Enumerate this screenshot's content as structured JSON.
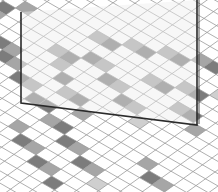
{
  "scene": {
    "description": "Perspective illustration of a diamond-tiled floor with a standing glass panel",
    "colors": {
      "background": "#ffffff",
      "grid_line": "#9a9a9a",
      "tile_dark": "#7c7c7c",
      "tile_mid": "#a6a6a6",
      "tile_light": "#cfcfcf",
      "panel_frame": "#2a2a2a",
      "panel_glass": "#eeeeee"
    },
    "panel": {
      "top_left": [
        21,
        12
      ],
      "bottom_left": [
        21,
        103
      ],
      "bottom_right": [
        197,
        125
      ],
      "top_right": [
        197,
        0
      ]
    },
    "shaded_tiles": [
      [
        2,
        9,
        "d"
      ],
      [
        3,
        9,
        "m"
      ],
      [
        3,
        10,
        "d"
      ],
      [
        4,
        10,
        "m"
      ],
      [
        5,
        11,
        "d"
      ],
      [
        6,
        11,
        "m"
      ],
      [
        7,
        12,
        "d"
      ],
      [
        8,
        12,
        "d"
      ],
      [
        9,
        13,
        "m"
      ],
      [
        10,
        13,
        "d"
      ],
      [
        11,
        14,
        "d"
      ],
      [
        12,
        14,
        "m"
      ],
      [
        13,
        15,
        "d"
      ],
      [
        14,
        15,
        "m"
      ],
      [
        15,
        16,
        "l"
      ],
      [
        6,
        4,
        "m"
      ],
      [
        7,
        4,
        "d"
      ],
      [
        8,
        3,
        "m"
      ],
      [
        9,
        3,
        "d"
      ],
      [
        10,
        2,
        "m"
      ],
      [
        11,
        2,
        "d"
      ],
      [
        12,
        1,
        "m"
      ],
      [
        13,
        1,
        "d"
      ],
      [
        7,
        6,
        "d"
      ],
      [
        8,
        6,
        "m"
      ],
      [
        9,
        7,
        "d"
      ],
      [
        10,
        7,
        "m"
      ],
      [
        11,
        8,
        "d"
      ],
      [
        12,
        8,
        "m"
      ],
      [
        13,
        9,
        "l"
      ],
      [
        5,
        7,
        "m"
      ],
      [
        6,
        7,
        "d"
      ],
      [
        6,
        8,
        "m"
      ],
      [
        7,
        9,
        "d"
      ],
      [
        8,
        10,
        "m"
      ],
      [
        9,
        10,
        "d"
      ],
      [
        10,
        11,
        "m"
      ],
      [
        11,
        5,
        "m"
      ],
      [
        12,
        5,
        "d"
      ],
      [
        13,
        4,
        "m"
      ],
      [
        14,
        4,
        "d"
      ],
      [
        15,
        3,
        "l"
      ],
      [
        14,
        6,
        "m"
      ],
      [
        15,
        6,
        "d"
      ],
      [
        16,
        7,
        "m"
      ],
      [
        4,
        13,
        "l"
      ],
      [
        8,
        15,
        "m"
      ],
      [
        9,
        16,
        "d"
      ],
      [
        10,
        16,
        "m"
      ],
      [
        11,
        17,
        "d"
      ],
      [
        12,
        17,
        "m"
      ],
      [
        13,
        18,
        "d"
      ],
      [
        0,
        6,
        "d"
      ],
      [
        0,
        7,
        "m"
      ],
      [
        1,
        5,
        "m"
      ],
      [
        -1,
        8,
        "l"
      ],
      [
        16,
        12,
        "m"
      ],
      [
        17,
        13,
        "d"
      ],
      [
        18,
        13,
        "m"
      ]
    ]
  }
}
